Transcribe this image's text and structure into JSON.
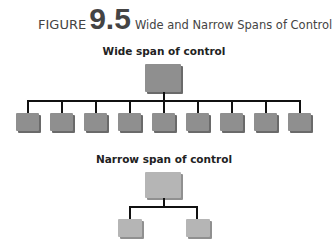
{
  "figure": {
    "label": "FIGURE",
    "number": "9.5",
    "caption": "Wide and Narrow Spans of Control"
  },
  "wide": {
    "title": "Wide span of control",
    "manager_count": 1,
    "subordinate_count": 9,
    "box_color": "#8f8f8f"
  },
  "narrow": {
    "title": "Narrow span of control",
    "manager_count": 1,
    "subordinate_count": 2,
    "box_color": "#b5b5b5"
  }
}
